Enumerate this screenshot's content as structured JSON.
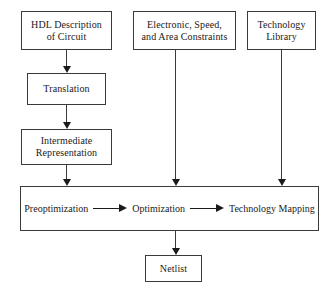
{
  "diagram": {
    "canvas": {
      "width": 335,
      "height": 295
    },
    "style": {
      "background": "#ffffff",
      "box_stroke": "#3a3a3a",
      "arrow_color": "#1a1a1a",
      "text_color": "#1a1a1a"
    },
    "nodes": {
      "hdl": {
        "label": "HDL Description\nof Circuit"
      },
      "translation": {
        "label": "Translation"
      },
      "intermediate": {
        "label": "Intermediate\nRepresentation"
      },
      "constraints": {
        "label": "Electronic, Speed,\nand Area Constraints"
      },
      "technology_library": {
        "label": "Technology\nLibrary"
      },
      "netlist": {
        "label": "Netlist"
      }
    },
    "main_bar": {
      "stages": [
        {
          "label": "Preoptimization"
        },
        {
          "label": "Optimization"
        },
        {
          "label": "Technology Mapping"
        }
      ]
    },
    "edges": [
      {
        "from": "hdl",
        "to": "translation",
        "direction": "down"
      },
      {
        "from": "translation",
        "to": "intermediate",
        "direction": "down"
      },
      {
        "from": "intermediate",
        "to": "main_bar",
        "direction": "down"
      },
      {
        "from": "constraints",
        "to": "main_bar",
        "direction": "down"
      },
      {
        "from": "technology_library",
        "to": "main_bar",
        "direction": "down"
      },
      {
        "from": "main_bar",
        "to": "netlist",
        "direction": "down"
      },
      {
        "from": "preoptimization",
        "to": "optimization",
        "direction": "right"
      },
      {
        "from": "optimization",
        "to": "technology_mapping",
        "direction": "right"
      }
    ]
  }
}
